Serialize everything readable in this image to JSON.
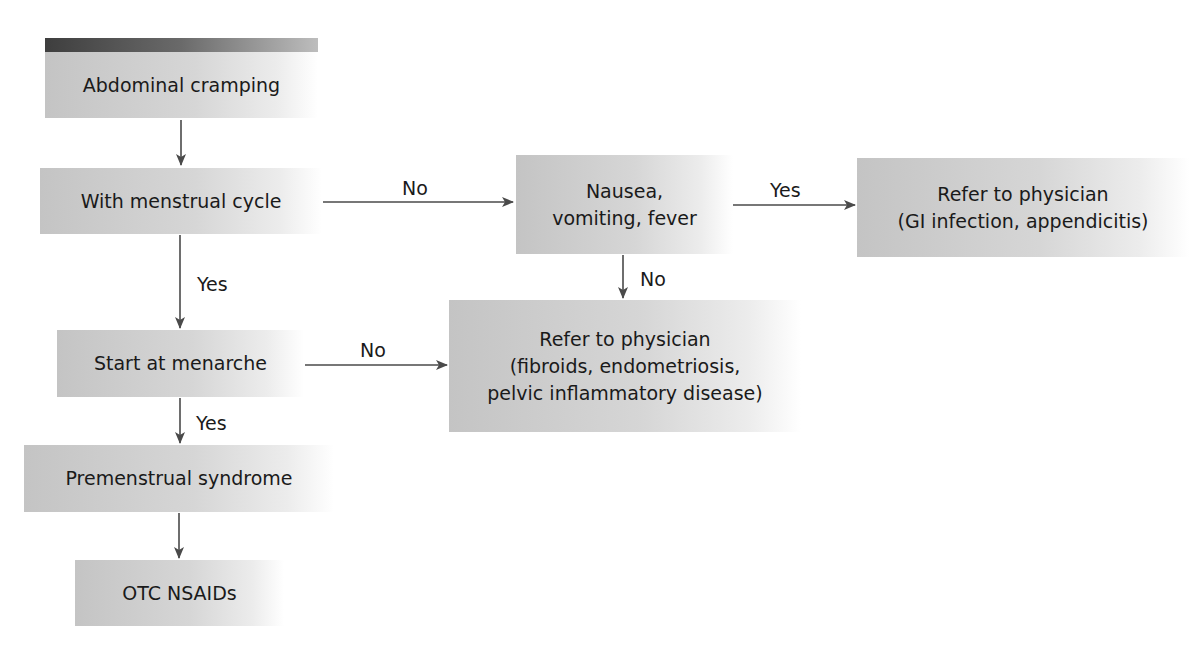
{
  "diagram": {
    "type": "flowchart",
    "nodes": {
      "abdominal_cramping": "Abdominal cramping",
      "with_menstrual_cycle": "With menstrual cycle",
      "nausea_line1": "Nausea,",
      "nausea_line2": "vomiting, fever",
      "refer_gi_line1": "Refer to physician",
      "refer_gi_line2": "(GI infection, appendicitis)",
      "refer_fibroids_line1": "Refer to physician",
      "refer_fibroids_line2": "(fibroids, endometriosis,",
      "refer_fibroids_line3": "pelvic inflammatory disease)",
      "start_at_menarche": "Start at menarche",
      "premenstrual_syndrome": "Premenstrual syndrome",
      "otc_nsaids": "OTC NSAIDs"
    },
    "edge_labels": {
      "cycle_to_nausea": "No",
      "nausea_to_refer_gi": "Yes",
      "nausea_to_refer_fibroids": "No",
      "cycle_to_menarche": "Yes",
      "menarche_to_refer_fibroids": "No",
      "menarche_to_pms": "Yes"
    },
    "edges": [
      {
        "from": "Abdominal cramping",
        "to": "With menstrual cycle",
        "label": ""
      },
      {
        "from": "With menstrual cycle",
        "to": "Nausea, vomiting, fever",
        "label": "No"
      },
      {
        "from": "Nausea, vomiting, fever",
        "to": "Refer to physician (GI infection, appendicitis)",
        "label": "Yes"
      },
      {
        "from": "Nausea, vomiting, fever",
        "to": "Refer to physician (fibroids, endometriosis, pelvic inflammatory disease)",
        "label": "No"
      },
      {
        "from": "With menstrual cycle",
        "to": "Start at menarche",
        "label": "Yes"
      },
      {
        "from": "Start at menarche",
        "to": "Refer to physician (fibroids, endometriosis, pelvic inflammatory disease)",
        "label": "No"
      },
      {
        "from": "Start at menarche",
        "to": "Premenstrual syndrome",
        "label": "Yes"
      },
      {
        "from": "Premenstrual syndrome",
        "to": "OTC NSAIDs",
        "label": ""
      }
    ],
    "colors": {
      "box_fill": "#c8c8c8",
      "top_bar": "#3e3e3e",
      "arrow": "#4a4a4a",
      "text": "#1a1a1a"
    }
  }
}
